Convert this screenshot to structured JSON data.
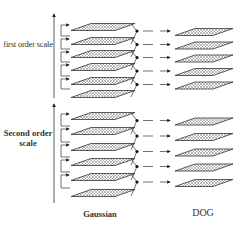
{
  "diagram": {
    "type": "scale-space pyramid (Gaussian to Difference-of-Gaussian)",
    "labels": {
      "first_order": "first order scale",
      "second_order": "Second order scale",
      "gaussian": "Gaussian",
      "dog": "DOG"
    },
    "groups": [
      {
        "name": "first order scale",
        "gaussian_layers": 6,
        "dog_layers": 5,
        "gaussian_y": [
          27,
          41,
          54,
          67,
          81,
          94
        ],
        "dog_y": [
          27,
          40,
          54,
          67,
          80
        ]
      },
      {
        "name": "Second order scale",
        "gaussian_layers": 6,
        "dog_layers": 5,
        "gaussian_y": [
          116,
          131,
          147,
          162,
          177,
          193
        ],
        "dog_y": [
          121,
          136,
          150,
          165,
          180
        ]
      }
    ],
    "colors": {
      "line": "#333333",
      "hatch": "#666666"
    }
  }
}
